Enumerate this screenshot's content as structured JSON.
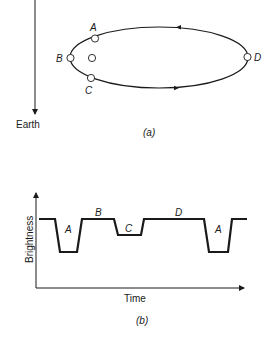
{
  "figure_a": {
    "caption": "(a)",
    "earth_label": "Earth",
    "points": [
      {
        "id": "A",
        "label": "A"
      },
      {
        "id": "B",
        "label": "B"
      },
      {
        "id": "C",
        "label": "C"
      },
      {
        "id": "D",
        "label": "D"
      }
    ],
    "description": "Elliptical orbit of a companion star around a central star, with positions A, B, C, D marked; arrow pointing toward Earth"
  },
  "figure_b": {
    "caption": "(b)",
    "y_axis_label": "Brightness",
    "x_axis_label": "Time",
    "segment_labels": [
      "A",
      "B",
      "C",
      "D",
      "A"
    ]
  },
  "colors": {
    "line": "#1a1a1a",
    "background": "#ffffff"
  }
}
